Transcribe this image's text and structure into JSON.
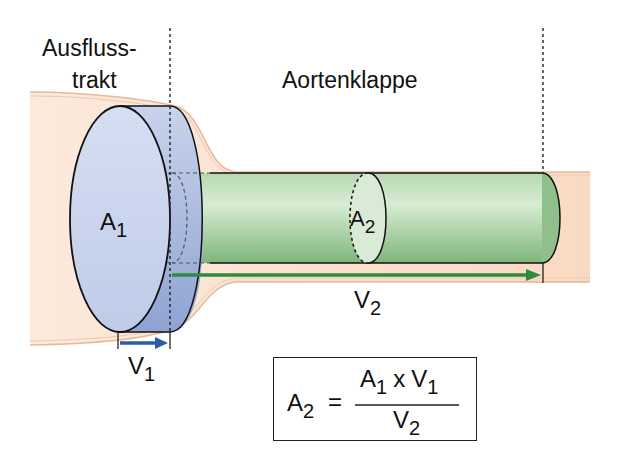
{
  "diagram": {
    "labels": {
      "outflow_tract_line1": "Ausfluss-",
      "outflow_tract_line2": "trakt",
      "aortic_valve": "Aortenklappe",
      "area1_main": "A",
      "area1_sub": "1",
      "area2_main": "A",
      "area2_sub": "2",
      "velocity1_main": "V",
      "velocity1_sub": "1",
      "velocity2_main": "V",
      "velocity2_sub": "2"
    },
    "formula": {
      "lhs_main": "A",
      "lhs_sub": "2",
      "equals": "=",
      "numerator": {
        "a_main": "A",
        "a_sub": "1",
        "op": "x",
        "v_main": "V",
        "v_sub": "1"
      },
      "denominator": {
        "v_main": "V",
        "v_sub": "2"
      }
    },
    "colors": {
      "vessel_tissue": "#f9d9c2",
      "vessel_edge": "#e8b89a",
      "lvot_disk_face": "#c9d5ec",
      "lvot_disk_side": "#9fb0d8",
      "aortic_cylinder": "#9cc99a",
      "velocity1_arrow": "#2d5ca8",
      "velocity2_arrow": "#2e8b3e",
      "outline": "#111111"
    }
  }
}
